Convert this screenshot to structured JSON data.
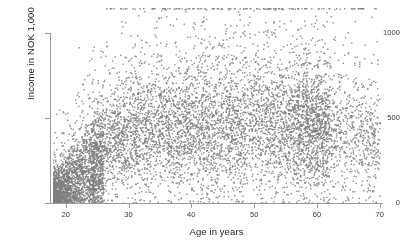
{
  "figure": {
    "width": 400,
    "height": 249,
    "background": "#ffffff",
    "point_color": "#7d7d7d"
  },
  "chart_data": {
    "type": "scatter",
    "title": "",
    "subtitle": "",
    "xlabel": "Age in years",
    "ylabel": "Income in NOK 1,000",
    "xlim": [
      17.5,
      70.5
    ],
    "ylim": [
      0,
      1160
    ],
    "xticks": [
      20,
      30,
      40,
      50,
      60,
      70
    ],
    "xtick_labels": [
      "20",
      "30",
      "40",
      "50",
      "60",
      "70"
    ],
    "yticks": [
      0,
      500,
      1000
    ],
    "ytick_labels": [
      "0",
      "500",
      "1000"
    ],
    "grid": false,
    "legend": null,
    "marker": {
      "shape": "square",
      "size_px": 1.3,
      "color": "#7d7d7d",
      "alpha": 0.75
    },
    "n_points": 9000,
    "spines": [
      "left",
      "bottom"
    ],
    "annotations": [
      "Dense low-income cluster at ages 18-24 near income 0-250",
      "Income rises steeply from age 18 to ~30, plateaus near 450-500 from age 30 to 60",
      "Slight decline in spread after age 62",
      "Top-coded row of points along the upper edge near income 1150"
    ],
    "distribution_model": {
      "x_min": 18,
      "x_max": 70,
      "median_curve": [
        {
          "age": 18,
          "income": 70
        },
        {
          "age": 20,
          "income": 130
        },
        {
          "age": 22,
          "income": 200
        },
        {
          "age": 25,
          "income": 290
        },
        {
          "age": 28,
          "income": 350
        },
        {
          "age": 30,
          "income": 385
        },
        {
          "age": 35,
          "income": 420
        },
        {
          "age": 40,
          "income": 440
        },
        {
          "age": 45,
          "income": 450
        },
        {
          "age": 50,
          "income": 450
        },
        {
          "age": 55,
          "income": 440
        },
        {
          "age": 60,
          "income": 425
        },
        {
          "age": 65,
          "income": 395
        },
        {
          "age": 70,
          "income": 370
        }
      ],
      "spread_curve": [
        {
          "age": 18,
          "sd": 60
        },
        {
          "age": 22,
          "sd": 110
        },
        {
          "age": 26,
          "sd": 150
        },
        {
          "age": 30,
          "sd": 175
        },
        {
          "age": 40,
          "sd": 190
        },
        {
          "age": 50,
          "sd": 195
        },
        {
          "age": 60,
          "sd": 185
        },
        {
          "age": 70,
          "sd": 165
        }
      ],
      "top_code_value": 1150,
      "top_code_fraction": 0.012
    }
  }
}
